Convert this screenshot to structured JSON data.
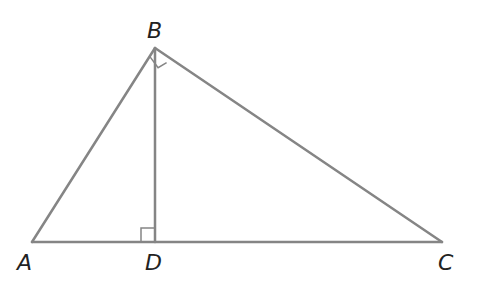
{
  "diagram": {
    "type": "right-triangle-with-altitude",
    "stroke_color": "#858585",
    "label_color": "#222222",
    "points": {
      "A": {
        "label": "A",
        "x": 32,
        "y": 242,
        "lx": 17,
        "ly": 270
      },
      "B": {
        "label": "B",
        "x": 155,
        "y": 48,
        "lx": 147,
        "ly": 38
      },
      "C": {
        "label": "C",
        "x": 442,
        "y": 242,
        "lx": 438,
        "ly": 270
      },
      "D": {
        "label": "D",
        "x": 155,
        "y": 242,
        "lx": 145,
        "ly": 270
      }
    },
    "segments": [
      "AB",
      "BC",
      "AC",
      "BD"
    ],
    "right_angles": [
      "ABC",
      "BDA"
    ]
  }
}
